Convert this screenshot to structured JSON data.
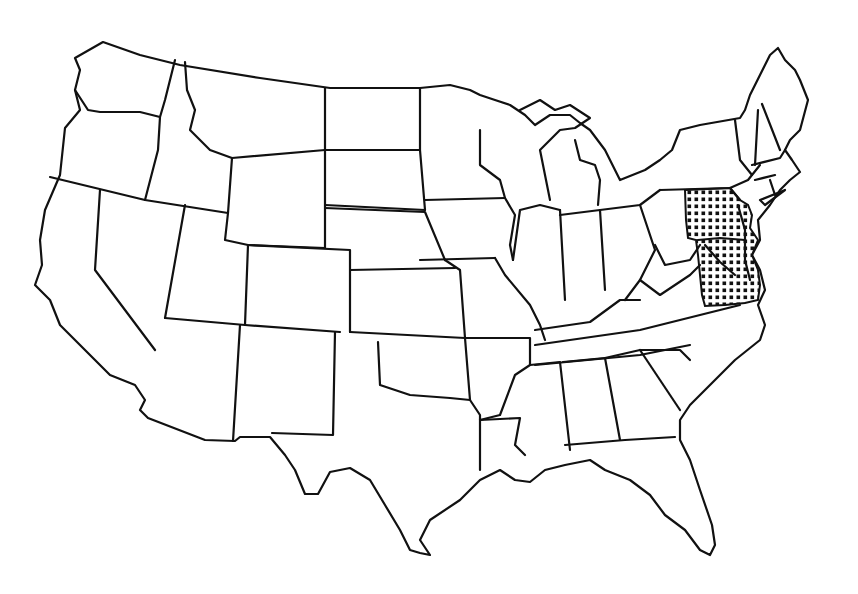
{
  "map": {
    "type": "outline map",
    "region": "Contiguous United States",
    "style": "black line-art state boundaries on white background",
    "highlight": {
      "pattern": "dot-grid stipple",
      "color": "#111111",
      "areas": [
        "Pennsylvania (eastern)",
        "New Jersey",
        "Delaware",
        "Maryland",
        "Virginia (eastern)"
      ]
    },
    "colors": {
      "background": "#ffffff",
      "outline": "#111111"
    }
  }
}
